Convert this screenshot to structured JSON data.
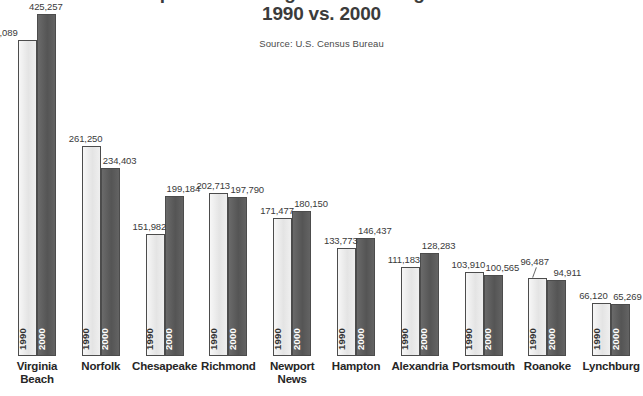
{
  "title": {
    "line1": "Population of Virginia's Ten Largest Cities",
    "line2": "1990 vs. 2000"
  },
  "source": "Source:  U.S. Census Bureau",
  "series_labels": {
    "s1990": "1990",
    "s2000": "2000"
  },
  "colors": {
    "bar_1990": "#e9e9e9",
    "bar_2000": "#5e5e5e",
    "bar_outline": "#4c4c4c",
    "text": "#3a3a3a",
    "background": "#ffffff"
  },
  "chart_data": {
    "type": "bar",
    "title": "Population of Virginia's Ten Largest Cities 1990 vs. 2000",
    "subtitle": "Source:  U.S. Census Bureau",
    "xlabel": "",
    "ylabel": "",
    "grid": false,
    "legend": "in-bar rotated year labels",
    "ylim": [
      0,
      440000
    ],
    "categories": [
      "Virginia Beach",
      "Norfolk",
      "Chesapeake",
      "Richmond",
      "Newport News",
      "Hampton",
      "Alexandria",
      "Portsmouth",
      "Roanoke",
      "Lynchburg"
    ],
    "category_lines": [
      [
        "Virginia",
        "Beach"
      ],
      [
        "Norfolk",
        ""
      ],
      [
        "Chesapeake",
        ""
      ],
      [
        "Richmond",
        ""
      ],
      [
        "Newport",
        "News"
      ],
      [
        "Hampton",
        ""
      ],
      [
        "Alexandria",
        ""
      ],
      [
        "Portsmouth",
        ""
      ],
      [
        "Roanoke",
        ""
      ],
      [
        "Lynchburg",
        ""
      ]
    ],
    "series": [
      {
        "name": "1990",
        "values": [
          393089,
          261250,
          151982,
          202713,
          171477,
          133773,
          111183,
          103910,
          96487,
          66120
        ],
        "labels": [
          "393,089",
          "261,250",
          "151,982",
          "202,713",
          "171,477",
          "133,773",
          "111,183",
          "103,910",
          "96,487",
          "66,120"
        ]
      },
      {
        "name": "2000",
        "values": [
          425257,
          234403,
          199184,
          197790,
          180150,
          146437,
          128283,
          100565,
          94911,
          65269
        ],
        "labels": [
          "425,257",
          "234,403",
          "199,184",
          "197,790",
          "180,150",
          "146,437",
          "128,283",
          "100,565",
          "94,911",
          "65,269"
        ]
      }
    ]
  }
}
